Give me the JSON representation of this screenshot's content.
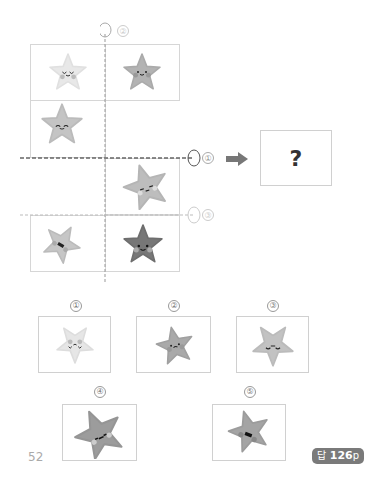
{
  "figure": {
    "axis_labels": {
      "vertical_axis_label": "②",
      "horizontal_axis_1_label": "①",
      "horizontal_axis_2_label": "③"
    },
    "question_mark": "?",
    "arrow": "right-arrow"
  },
  "grid_stars": [
    {
      "position": "top-left",
      "shade": "light",
      "face": "closed-eyes-smile"
    },
    {
      "position": "top-right",
      "shade": "medium",
      "face": "dot-eyes-smile"
    },
    {
      "position": "middle-left",
      "shade": "medium-light",
      "face": "arched-eyes-smile"
    },
    {
      "position": "middle-right",
      "shade": "medium-light",
      "face": "dash-eyes",
      "rotated": true
    },
    {
      "position": "bottom-left",
      "shade": "medium-light",
      "face": "open-mouth",
      "rotated": true
    },
    {
      "position": "bottom-right",
      "shade": "dark",
      "face": "dot-eyes-smile"
    }
  ],
  "options": [
    {
      "number": "①",
      "label": "option-1"
    },
    {
      "number": "②",
      "label": "option-2"
    },
    {
      "number": "③",
      "label": "option-3"
    },
    {
      "number": "④",
      "label": "option-4"
    },
    {
      "number": "⑤",
      "label": "option-5"
    }
  ],
  "footer": {
    "page_number": "52",
    "answer_ref_prefix": "답",
    "answer_ref_page": "126",
    "answer_ref_suffix": "p"
  }
}
